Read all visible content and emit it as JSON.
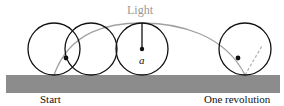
{
  "labels": {
    "light": "Light",
    "radius": "a",
    "start": "Start",
    "end": "One revolution"
  },
  "colors": {
    "ground": "#8c8c8c",
    "circle": "#111111",
    "cycloid": "#a0a0a0",
    "dashed": "#b0b0b0"
  }
}
